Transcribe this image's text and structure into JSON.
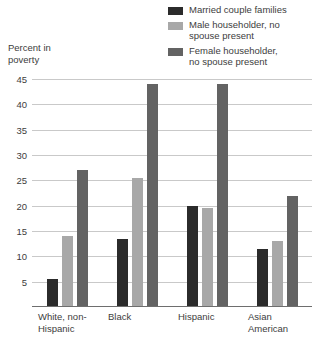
{
  "axis_title": "Percent in\npoverty",
  "legend": [
    {
      "label": "Married couple families",
      "color": "#2b2b2b",
      "name": "married-couple-families"
    },
    {
      "label": "Male householder, no\nspouse present",
      "color": "#a8a8a8",
      "name": "male-householder"
    },
    {
      "label": "Female householder,\nno spouse present",
      "color": "#636363",
      "name": "female-householder"
    }
  ],
  "chart_data": {
    "type": "bar",
    "title": "",
    "subtitle": "",
    "xlabel": "",
    "ylabel": "Percent in poverty",
    "ylim": [
      0,
      45
    ],
    "yticks": [
      5,
      10,
      15,
      20,
      25,
      30,
      35,
      40,
      45
    ],
    "ytick_labels": [
      "5",
      "10",
      "15",
      "20",
      "25",
      "30",
      "35",
      "40",
      "45"
    ],
    "grid": true,
    "legend_position": "top-right",
    "categories": [
      "White, non-\nHispanic",
      "Black",
      "Hispanic",
      "Asian\nAmerican"
    ],
    "series": [
      {
        "name": "Married couple families",
        "color": "#2b2b2b",
        "values": [
          5.5,
          13.5,
          20.0,
          11.5
        ]
      },
      {
        "name": "Male householder, no spouse present",
        "color": "#a8a8a8",
        "values": [
          14.0,
          25.5,
          19.5,
          13.0
        ]
      },
      {
        "name": "Female householder, no spouse present",
        "color": "#636363",
        "values": [
          27.0,
          44.0,
          44.0,
          22.0
        ]
      }
    ]
  }
}
